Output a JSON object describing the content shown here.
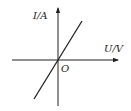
{
  "diagram": {
    "type": "I-U characteristic graph",
    "y_axis": {
      "label": "I/A"
    },
    "x_axis": {
      "label": "U/V"
    },
    "origin": {
      "label": "O"
    },
    "line": {
      "description": "straight line through origin with positive slope"
    },
    "colors": {
      "stroke": "#222222",
      "background": "#ffffff"
    }
  }
}
